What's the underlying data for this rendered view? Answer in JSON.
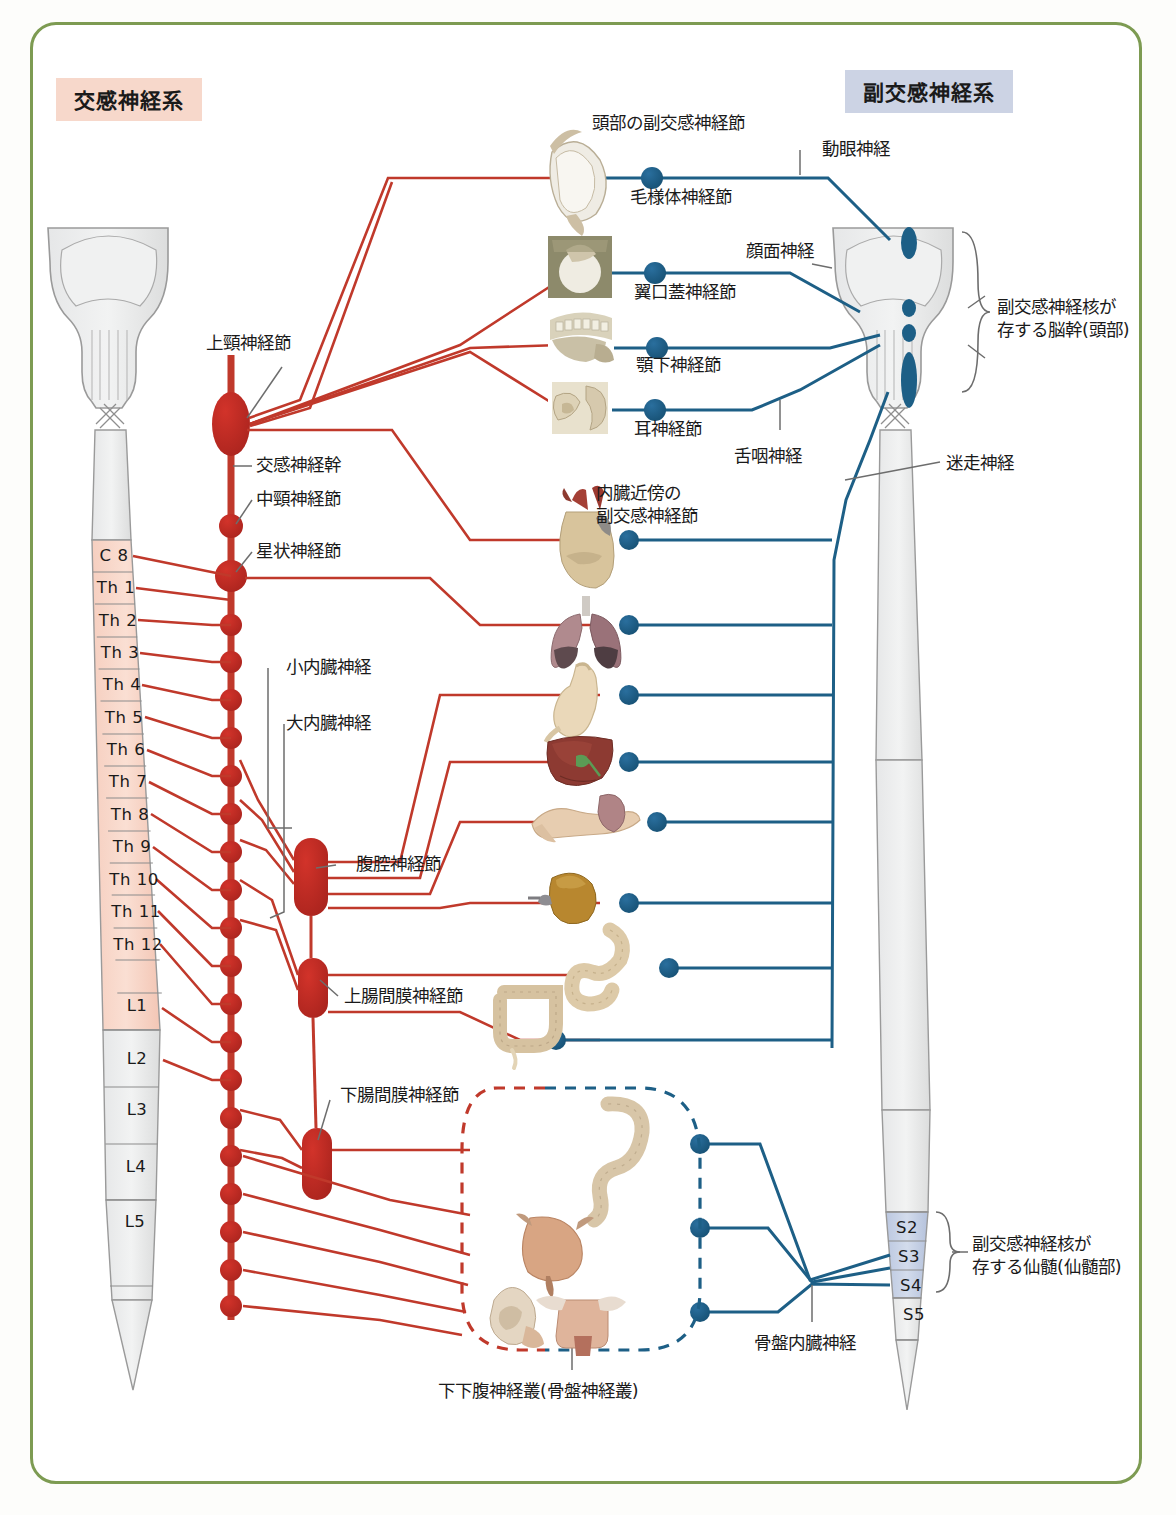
{
  "page": {
    "frame_color": "#7d9b52",
    "sympathetic_color": "#c0392b",
    "parasympathetic_color": "#1d5f86",
    "sympathetic_fill": "#f7d8cb",
    "parasympathetic_fill": "#ccd3e4"
  },
  "headers": {
    "sympathetic": "交感神経系",
    "parasympathetic": "副交感神経系"
  },
  "spinal_left": {
    "segments": [
      {
        "label": "C 8",
        "active": true
      },
      {
        "label": "Th 1",
        "active": true
      },
      {
        "label": "Th 2",
        "active": true
      },
      {
        "label": "Th 3",
        "active": true
      },
      {
        "label": "Th 4",
        "active": true
      },
      {
        "label": "Th 5",
        "active": true
      },
      {
        "label": "Th 6",
        "active": true
      },
      {
        "label": "Th 7",
        "active": true
      },
      {
        "label": "Th 8",
        "active": true
      },
      {
        "label": "Th 9",
        "active": true
      },
      {
        "label": "Th 10",
        "active": true
      },
      {
        "label": "Th 11",
        "active": true
      },
      {
        "label": "Th 12",
        "active": true
      },
      {
        "label": "L1",
        "active": true
      },
      {
        "label": "L2",
        "active": true
      },
      {
        "label": "L3",
        "active": false
      },
      {
        "label": "L4",
        "active": false
      },
      {
        "label": "L5",
        "active": false
      }
    ]
  },
  "spinal_right": {
    "segments": [
      {
        "label": "S2",
        "active": true
      },
      {
        "label": "S3",
        "active": true
      },
      {
        "label": "S4",
        "active": true
      },
      {
        "label": "S5",
        "active": false
      }
    ]
  },
  "sympathetic_labels": {
    "superior_cervical_ganglion": "上頸神経節",
    "sympathetic_trunk": "交感神経幹",
    "middle_cervical_ganglion": "中頸神経節",
    "stellate_ganglion": "星状神経節",
    "lesser_splanchnic_nerve": "小内臓神経",
    "greater_splanchnic_nerve": "大内臓神経",
    "celiac_ganglion": "腹腔神経節",
    "superior_mesenteric_ganglion": "上腸間膜神経節",
    "inferior_mesenteric_ganglion": "下腸間膜神経節"
  },
  "parasympathetic_labels": {
    "head_ganglia": "頭部の副交感神経節",
    "ciliary_ganglion": "毛様体神経節",
    "oculomotor_nerve": "動眼神経",
    "pterygopalatine_ganglion": "翼口蓋神経節",
    "facial_nerve": "顔面神経",
    "submandibular_ganglion": "顎下神経節",
    "otic_ganglion": "耳神経節",
    "glossopharyngeal_nerve": "舌咽神経",
    "vagus_nerve": "迷走神経",
    "brainstem_note": "副交感神経核が\n存する脳幹(頭部)",
    "sacral_note": "副交感神経核が\n存する仙髄(仙髄部)",
    "visceral_ganglia": "内臓近傍の\n副交感神経節",
    "pelvic_splanchnic_nerve": "骨盤内臓神経"
  },
  "bottom_labels": {
    "inferior_hypogastric_plexus": "下下腹神経叢(骨盤神経叢)"
  },
  "organs": [
    {
      "name": "eye",
      "icon": "eye-image"
    },
    {
      "name": "lacrimal-orbit",
      "icon": "orbit-image"
    },
    {
      "name": "jaw-teeth",
      "icon": "jaw-image"
    },
    {
      "name": "ear",
      "icon": "ear-image"
    },
    {
      "name": "heart",
      "icon": "heart-image"
    },
    {
      "name": "lungs",
      "icon": "lungs-image"
    },
    {
      "name": "stomach",
      "icon": "stomach-image"
    },
    {
      "name": "liver",
      "icon": "liver-image"
    },
    {
      "name": "pancreas-spleen",
      "icon": "pancreas-image"
    },
    {
      "name": "kidney",
      "icon": "kidney-image"
    },
    {
      "name": "small-intestine",
      "icon": "small-intestine-image"
    },
    {
      "name": "large-intestine",
      "icon": "large-intestine-image"
    },
    {
      "name": "rectum",
      "icon": "rectum-image"
    },
    {
      "name": "bladder",
      "icon": "bladder-image"
    },
    {
      "name": "male-genitalia",
      "icon": "male-genitalia-image"
    },
    {
      "name": "female-genitalia",
      "icon": "female-genitalia-image"
    }
  ]
}
